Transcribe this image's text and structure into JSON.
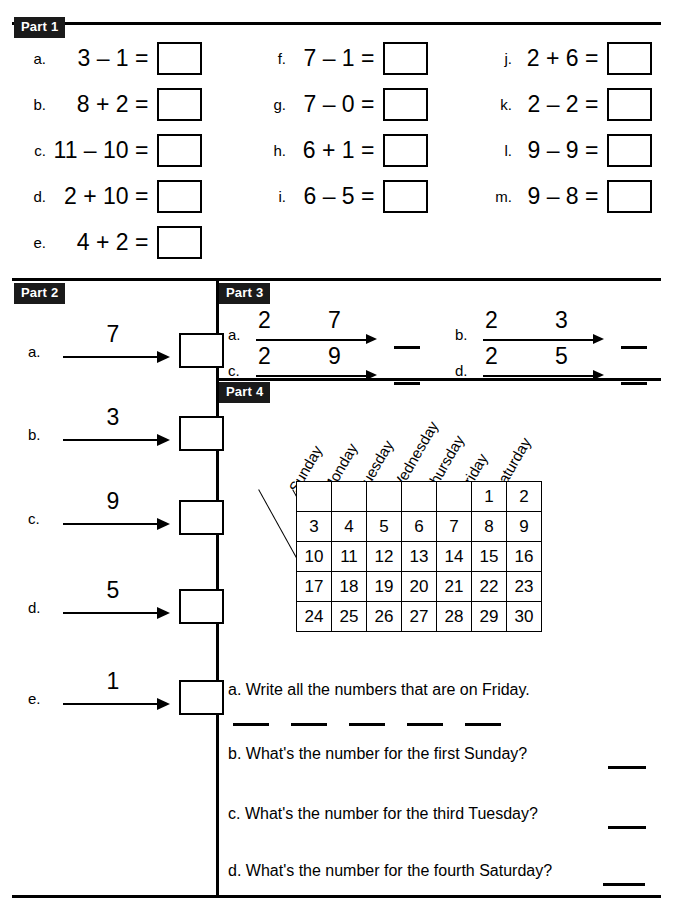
{
  "worksheet": {
    "parts": {
      "part1_label": "Part 1",
      "part2_label": "Part 2",
      "part3_label": "Part 3",
      "part4_label": "Part 4"
    }
  },
  "part1": {
    "items": [
      {
        "letter": "a.",
        "expr": "3 – 1 ="
      },
      {
        "letter": "b.",
        "expr": "8 + 2 ="
      },
      {
        "letter": "c.",
        "expr": "11 – 10 ="
      },
      {
        "letter": "d.",
        "expr": "2 + 10 ="
      },
      {
        "letter": "e.",
        "expr": "4 + 2 ="
      },
      {
        "letter": "f.",
        "expr": "7 – 1 ="
      },
      {
        "letter": "g.",
        "expr": "7 – 0 ="
      },
      {
        "letter": "h.",
        "expr": "6 + 1 ="
      },
      {
        "letter": "i.",
        "expr": "6 – 5 ="
      },
      {
        "letter": "j.",
        "expr": "2 + 6 ="
      },
      {
        "letter": "k.",
        "expr": "2 – 2 ="
      },
      {
        "letter": "l.",
        "expr": "9 – 9 ="
      },
      {
        "letter": "m.",
        "expr": "9 – 8 ="
      }
    ]
  },
  "part2": {
    "items": [
      {
        "letter": "a.",
        "number": "7"
      },
      {
        "letter": "b.",
        "number": "3"
      },
      {
        "letter": "c.",
        "number": "9"
      },
      {
        "letter": "d.",
        "number": "5"
      },
      {
        "letter": "e.",
        "number": "1"
      }
    ]
  },
  "part3": {
    "items": [
      {
        "letter": "a.",
        "start": "2",
        "count": "7"
      },
      {
        "letter": "b.",
        "start": "2",
        "count": "3"
      },
      {
        "letter": "c.",
        "start": "2",
        "count": "9"
      },
      {
        "letter": "d.",
        "start": "2",
        "count": "5"
      }
    ]
  },
  "part4": {
    "day_headers": [
      "Sunday",
      "Monday",
      "Tuesday",
      "Wednesday",
      "Thursday",
      "Friday",
      "Saturday"
    ],
    "calendar_rows": [
      [
        "",
        "",
        "",
        "",
        "",
        "1",
        "2"
      ],
      [
        "3",
        "4",
        "5",
        "6",
        "7",
        "8",
        "9"
      ],
      [
        "10",
        "11",
        "12",
        "13",
        "14",
        "15",
        "16"
      ],
      [
        "17",
        "18",
        "19",
        "20",
        "21",
        "22",
        "23"
      ],
      [
        "24",
        "25",
        "26",
        "27",
        "28",
        "29",
        "30"
      ]
    ],
    "questions": [
      {
        "letter": "a.",
        "text": "a. Write all the numbers that are on Friday.",
        "blanks": 5
      },
      {
        "letter": "b.",
        "text": "b. What's the number for the first Sunday?",
        "blanks": 1
      },
      {
        "letter": "c.",
        "text": "c. What's the number for the third Tuesday?",
        "blanks": 1
      },
      {
        "letter": "d.",
        "text": "d. What's the number for the fourth Saturday?",
        "blanks": 1
      }
    ]
  }
}
